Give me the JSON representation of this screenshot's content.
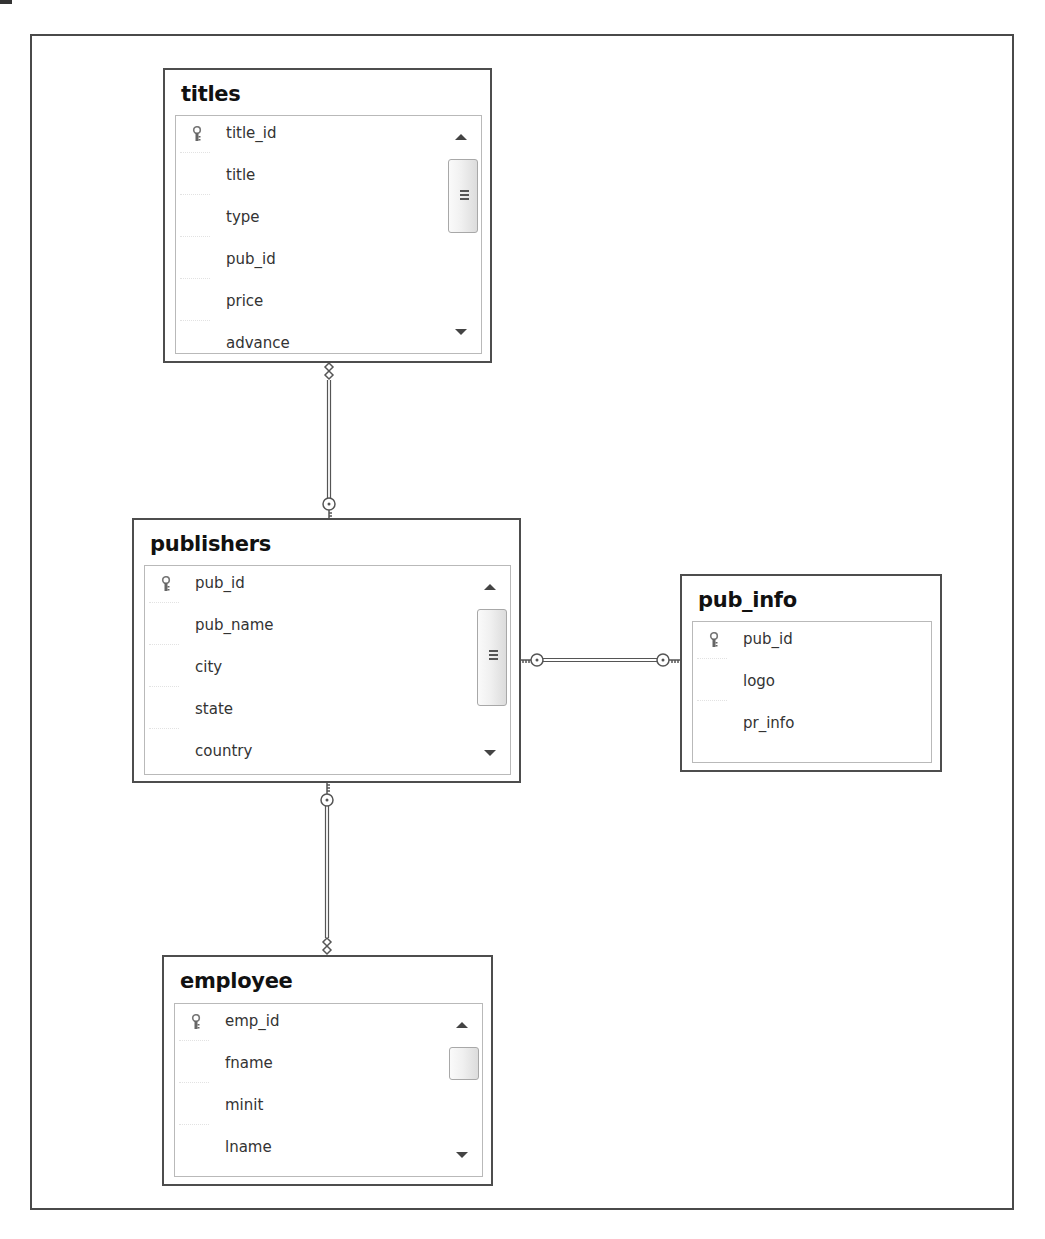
{
  "diagram": {
    "type": "database-diagram",
    "tables": [
      {
        "name": "titles",
        "columns": [
          {
            "name": "title_id",
            "primary_key": true
          },
          {
            "name": "title",
            "primary_key": false
          },
          {
            "name": "type",
            "primary_key": false
          },
          {
            "name": "pub_id",
            "primary_key": false
          },
          {
            "name": "price",
            "primary_key": false
          },
          {
            "name": "advance",
            "primary_key": false
          }
        ],
        "scrollable": true
      },
      {
        "name": "publishers",
        "columns": [
          {
            "name": "pub_id",
            "primary_key": true
          },
          {
            "name": "pub_name",
            "primary_key": false
          },
          {
            "name": "city",
            "primary_key": false
          },
          {
            "name": "state",
            "primary_key": false
          },
          {
            "name": "country",
            "primary_key": false
          }
        ],
        "scrollable": true
      },
      {
        "name": "pub_info",
        "columns": [
          {
            "name": "pub_id",
            "primary_key": true
          },
          {
            "name": "logo",
            "primary_key": false
          },
          {
            "name": "pr_info",
            "primary_key": false
          }
        ],
        "scrollable": false
      },
      {
        "name": "employee",
        "columns": [
          {
            "name": "emp_id",
            "primary_key": true
          },
          {
            "name": "fname",
            "primary_key": false
          },
          {
            "name": "minit",
            "primary_key": false
          },
          {
            "name": "lname",
            "primary_key": false
          }
        ],
        "scrollable": true
      }
    ],
    "relationships": [
      {
        "from": "publishers",
        "to": "titles",
        "one_end": "publishers",
        "many_end": "titles"
      },
      {
        "from": "publishers",
        "to": "pub_info",
        "one_end": "publishers",
        "many_end": "pub_info"
      },
      {
        "from": "publishers",
        "to": "employee",
        "one_end": "publishers",
        "many_end": "employee"
      }
    ]
  },
  "colors": {
    "border": "#4d4d4d",
    "inner_border": "#b9b9b9",
    "text": "#333333",
    "title": "#111111",
    "background": "#ffffff"
  }
}
